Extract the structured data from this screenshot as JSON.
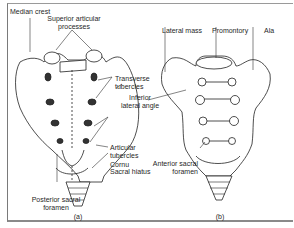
{
  "figure": {
    "panel_a": {
      "caption": "(a)",
      "view": "posterior",
      "labels": {
        "median_crest": "Median crest",
        "superior_articular_1": "Superior articular",
        "superior_articular_2": "processes",
        "transverse_1": "Transverse",
        "transverse_2": "tubercles",
        "inferior_1": "Inferior",
        "inferior_2": "lateral angle",
        "articular_1": "Articular",
        "articular_2": "tubercles",
        "cornu": "Cornu",
        "sacral_hiatus": "Sacral hiatus",
        "posterior_foramen_1": "Posterior sacral",
        "posterior_foramen_2": "foramen"
      }
    },
    "panel_b": {
      "caption": "(b)",
      "view": "anterior",
      "labels": {
        "lateral_mass": "Lateral mass",
        "promontory": "Promontory",
        "ala": "Ala",
        "anterior_foramen_1": "Anterior sacral",
        "anterior_foramen_2": "foramen"
      }
    },
    "colors": {
      "ink": "#1f1f1f",
      "frame": "#8a8a8a",
      "background": "#ffffff"
    }
  }
}
